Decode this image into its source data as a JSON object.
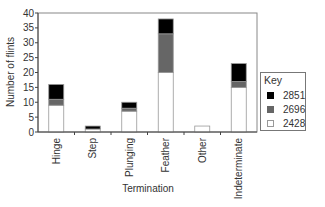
{
  "chart_data": {
    "type": "bar",
    "stacked": true,
    "title": "",
    "xlabel": "Termination",
    "ylabel": "Number of flints",
    "ylim": [
      0,
      40
    ],
    "yticks": [
      0,
      5,
      10,
      15,
      20,
      25,
      30,
      35,
      40
    ],
    "grid": false,
    "categories": [
      "Hinge",
      "Step",
      "Plunging",
      "Feather",
      "Other",
      "Indeterminate"
    ],
    "series": [
      {
        "name": "2428",
        "color": "#ffffff",
        "values": [
          9,
          1,
          7,
          20,
          2,
          15
        ]
      },
      {
        "name": "2696",
        "color": "#666666",
        "values": [
          2,
          0,
          1,
          13,
          0,
          2
        ]
      },
      {
        "name": "2851",
        "color": "#000000",
        "values": [
          5,
          1,
          2,
          5,
          0,
          6
        ]
      }
    ],
    "legend": {
      "title": "Key",
      "position": "right",
      "entries": [
        {
          "label": "2851",
          "color": "#000000"
        },
        {
          "label": "2696",
          "color": "#666666"
        },
        {
          "label": "2428",
          "color": "#ffffff"
        }
      ]
    }
  },
  "legend": {
    "title": "Key",
    "items": [
      {
        "label": "2851"
      },
      {
        "label": "2696"
      },
      {
        "label": "2428"
      }
    ]
  },
  "axes": {
    "xlabel": "Termination",
    "ylabel": "Number of flints"
  }
}
